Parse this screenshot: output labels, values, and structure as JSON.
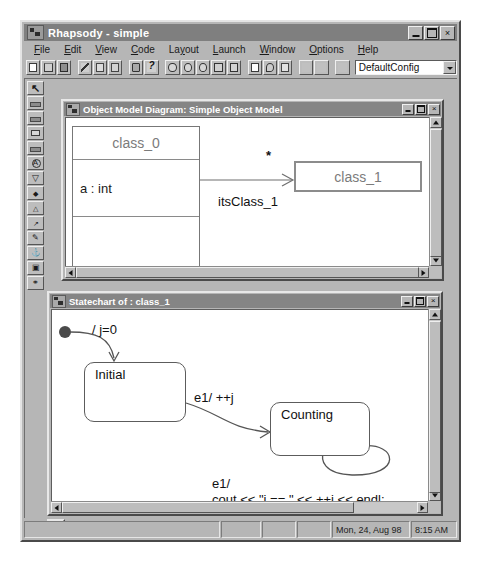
{
  "app": {
    "title": "Rhapsody - simple",
    "icon": "rhapsody-app-icon",
    "window_buttons": {
      "minimize": "_",
      "maximize": "□",
      "close": "×"
    }
  },
  "menu": {
    "items": [
      {
        "label": "File",
        "mnemonic": "F"
      },
      {
        "label": "Edit",
        "mnemonic": "E"
      },
      {
        "label": "View",
        "mnemonic": "V"
      },
      {
        "label": "Code",
        "mnemonic": "C"
      },
      {
        "label": "Layout",
        "mnemonic": "y"
      },
      {
        "label": "Launch",
        "mnemonic": "L"
      },
      {
        "label": "Window",
        "mnemonic": "W"
      },
      {
        "label": "Options",
        "mnemonic": "O"
      },
      {
        "label": "Help",
        "mnemonic": "H"
      }
    ]
  },
  "toolbar": {
    "buttons": [
      {
        "name": "new-document-icon",
        "enabled": true
      },
      {
        "name": "open-folder-icon",
        "enabled": true
      },
      {
        "name": "save-disk-icon",
        "enabled": true
      },
      {
        "name": "cut-scissors-icon",
        "enabled": true
      },
      {
        "name": "copy-icon",
        "enabled": true
      },
      {
        "name": "paste-icon",
        "enabled": true
      },
      {
        "name": "print-icon",
        "enabled": true
      },
      {
        "name": "help-question-icon",
        "enabled": true
      },
      {
        "name": "zoom-in-icon",
        "enabled": true
      },
      {
        "name": "zoom-out-icon",
        "enabled": true
      },
      {
        "name": "zoom-selection-icon",
        "enabled": true
      },
      {
        "name": "fit-to-window-icon",
        "enabled": true
      },
      {
        "name": "refresh-icon",
        "enabled": true
      },
      {
        "name": "new-diagram-icon",
        "enabled": true
      },
      {
        "name": "search-magnifier-icon",
        "enabled": true
      },
      {
        "name": "properties-list-icon",
        "enabled": true
      },
      {
        "name": "stop-build-icon",
        "enabled": false
      },
      {
        "name": "run-icon",
        "enabled": false
      },
      {
        "name": "animate-icon",
        "enabled": false
      }
    ],
    "config_combo": {
      "value": "DefaultConfig",
      "arrow_icon": "chevron-down-icon"
    }
  },
  "palette": {
    "tools": [
      {
        "name": "select-arrow-tool",
        "glyph": "↖"
      },
      {
        "name": "package-tool",
        "glyph": ""
      },
      {
        "name": "class-tool",
        "glyph": ""
      },
      {
        "name": "object-tool",
        "glyph": ""
      },
      {
        "name": "actor-tool",
        "glyph": ""
      },
      {
        "name": "association-tool",
        "glyph": "A"
      },
      {
        "name": "aggregation-tool",
        "glyph": "▽"
      },
      {
        "name": "composition-tool",
        "glyph": ""
      },
      {
        "name": "inheritance-tool",
        "glyph": ""
      },
      {
        "name": "dependency-tool",
        "glyph": ""
      },
      {
        "name": "comment-tool",
        "glyph": "⚯"
      },
      {
        "name": "anchor-tool",
        "glyph": "⚓"
      },
      {
        "name": "image-tool",
        "glyph": "▣"
      },
      {
        "name": "constraint-tool",
        "glyph": "⚲"
      }
    ]
  },
  "omd_window": {
    "title": "Object Model Diagram: Simple Object Model",
    "icon": "diagram-window-icon",
    "buttons": {
      "minimize": "_",
      "maximize": "□",
      "close": "×"
    },
    "diagram": {
      "class_0": {
        "name": "class_0",
        "attribute": "a : int",
        "operations": ""
      },
      "class_1": {
        "name": "class_1"
      },
      "association": {
        "role_label": "itsClass_1",
        "multiplicity": "*"
      }
    }
  },
  "statechart_window": {
    "title": "Statechart of : class_1",
    "icon": "statechart-window-icon",
    "buttons": {
      "minimize": "_",
      "maximize": "□",
      "close": "×"
    },
    "diagram": {
      "default_transition_action": "/ j=0",
      "states": [
        {
          "name": "Initial"
        },
        {
          "name": "Counting"
        }
      ],
      "transitions": [
        {
          "label": "e1/ ++j"
        },
        {
          "label_line1": "e1/",
          "label_line2": "cout << \"j == \" << ++j << endl;"
        }
      ]
    }
  },
  "statusbar": {
    "message": "",
    "panes": [
      "",
      "",
      "",
      ""
    ],
    "date": "Mon, 24, Aug 98",
    "time": "8:15 AM"
  }
}
